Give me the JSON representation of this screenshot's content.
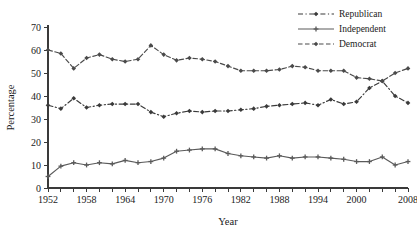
{
  "chart_data": {
    "type": "line",
    "title": "",
    "xlabel": "Year",
    "ylabel": "Percentage",
    "xlim": [
      1952,
      2008
    ],
    "ylim": [
      0,
      70
    ],
    "ytick_step": 10,
    "xtick_step": 2,
    "grid": false,
    "legend_position": "top-right",
    "yticks": [
      0,
      10,
      20,
      30,
      40,
      50,
      60,
      70
    ],
    "xticks": [
      1952,
      1954,
      1956,
      1958,
      1960,
      1962,
      1964,
      1966,
      1968,
      1970,
      1972,
      1974,
      1976,
      1978,
      1980,
      1982,
      1984,
      1986,
      1988,
      1990,
      1992,
      1994,
      1996,
      1998,
      2000,
      2002,
      2004,
      2006,
      2008
    ],
    "xtick_labels": [
      "1952",
      "",
      "",
      "1958",
      "",
      "",
      "1964",
      "",
      "",
      "1970",
      "",
      "",
      "1976",
      "",
      "",
      "1982",
      "",
      "",
      "1988",
      "",
      "",
      "1994",
      "",
      "",
      "2000",
      "",
      "",
      "",
      "2008"
    ],
    "x": [
      1952,
      1954,
      1956,
      1958,
      1960,
      1962,
      1964,
      1966,
      1968,
      1970,
      1972,
      1974,
      1976,
      1978,
      1980,
      1982,
      1984,
      1986,
      1988,
      1990,
      1992,
      1994,
      1996,
      1998,
      2000,
      2002,
      2004,
      2006,
      2008
    ],
    "series": [
      {
        "name": "Republican",
        "line_style": "dashdot",
        "marker": "diamond",
        "color": "#3a3a3a",
        "values": [
          36,
          34.5,
          39,
          35,
          36,
          36.5,
          36.5,
          36.5,
          33,
          31,
          32.5,
          33.5,
          33,
          33.5,
          33.5,
          34,
          34.5,
          35.5,
          36,
          36.5,
          37,
          36,
          38.5,
          36.5,
          37.5,
          43.5,
          46.5,
          40,
          37
        ]
      },
      {
        "name": "Independent",
        "line_style": "solid",
        "marker": "plus",
        "color": "#5a5a5a",
        "values": [
          5,
          9.5,
          11,
          10,
          11,
          10.5,
          12,
          11,
          11.5,
          13,
          16,
          16.5,
          17,
          17,
          15,
          14,
          13.5,
          13,
          14,
          13,
          13.5,
          13.5,
          13,
          12.5,
          11.5,
          11.5,
          13.5,
          10,
          11.5
        ]
      },
      {
        "name": "Democrat",
        "line_style": "dashed",
        "marker": "diamond",
        "color": "#4a4a4a",
        "values": [
          60,
          58.5,
          52,
          56.5,
          58,
          56,
          55,
          56,
          62,
          58,
          55.5,
          56.5,
          56,
          55,
          53,
          51,
          51,
          51,
          51.5,
          53,
          52.5,
          51,
          51,
          51,
          48,
          47.5,
          46.5,
          50,
          52
        ]
      }
    ],
    "legend_entries": [
      {
        "label": "Republican",
        "line_style": "dashdot",
        "marker": "diamond",
        "color": "#3a3a3a"
      },
      {
        "label": "Independent",
        "line_style": "solid",
        "marker": "plus",
        "color": "#5a5a5a"
      },
      {
        "label": "Democrat",
        "line_style": "dashed",
        "marker": "diamond",
        "color": "#4a4a4a"
      }
    ]
  }
}
